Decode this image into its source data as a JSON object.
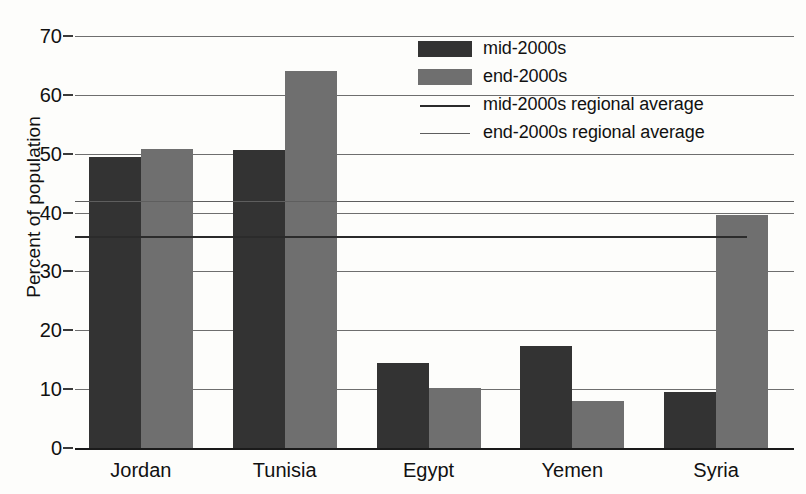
{
  "chart_data": {
    "type": "bar",
    "title": "",
    "xlabel": "",
    "ylabel": "Percent of population",
    "categories": [
      "Jordan",
      "Tunisia",
      "Egypt",
      "Yemen",
      "Syria"
    ],
    "ylim": [
      0,
      70
    ],
    "yticks": [
      0,
      10,
      20,
      30,
      40,
      50,
      60,
      70
    ],
    "grid": true,
    "legend_position": "top-right",
    "series": [
      {
        "name": "mid-2000s",
        "color": "#333333",
        "values": [
          49.5,
          50.7,
          14.5,
          17.3,
          9.5
        ]
      },
      {
        "name": "end-2000s",
        "color": "#6f6f6f",
        "values": [
          50.8,
          64.0,
          10.2,
          8.0,
          39.6
        ]
      }
    ],
    "reference_lines": [
      {
        "name": "mid-2000s regional average",
        "value": 36.0,
        "color": "#2b2b2b"
      },
      {
        "name": "end-2000s regional average",
        "value": 42.0,
        "color": "#5e5e5e"
      }
    ]
  },
  "legend": {
    "items": [
      {
        "label": "mid-2000s",
        "key": "swatch-mid",
        "icon": "legend-swatch-dark"
      },
      {
        "label": "end-2000s",
        "key": "swatch-end",
        "icon": "legend-swatch-gray"
      },
      {
        "label": "mid-2000s regional average",
        "key": "rule-mid",
        "icon": "legend-line-dark"
      },
      {
        "label": "end-2000s regional average",
        "key": "rule-end",
        "icon": "legend-line-gray"
      }
    ]
  }
}
